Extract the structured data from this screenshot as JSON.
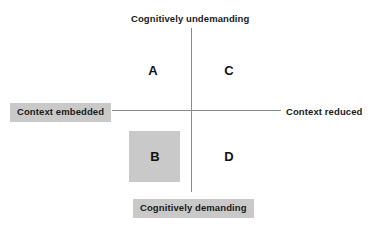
{
  "diagram": {
    "type": "quadrant-matrix",
    "axes": {
      "vertical": {
        "top_label": "Cognitively undemanding",
        "bottom_label": "Cognitively demanding",
        "top_label_boxed": false,
        "bottom_label_boxed": true
      },
      "horizontal": {
        "left_label": "Context embedded",
        "right_label": "Context reduced",
        "left_label_boxed": true,
        "right_label_boxed": false
      }
    },
    "quadrants": [
      {
        "letter": "A",
        "position": "top-left",
        "highlighted": false
      },
      {
        "letter": "C",
        "position": "top-right",
        "highlighted": false
      },
      {
        "letter": "B",
        "position": "bottom-left",
        "highlighted": true
      },
      {
        "letter": "D",
        "position": "bottom-right",
        "highlighted": false
      }
    ],
    "colors": {
      "background": "#ffffff",
      "axis_line": "#8a8a8a",
      "shade": "#c9c9c9",
      "text": "#1a1a1a"
    }
  }
}
